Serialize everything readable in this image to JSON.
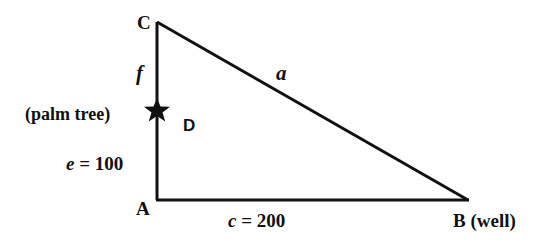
{
  "diagram": {
    "vertices": {
      "C": {
        "label": "C",
        "x": 157,
        "y": 22
      },
      "A": {
        "label": "A",
        "x": 157,
        "y": 200
      },
      "B": {
        "label": "B",
        "x": 468,
        "y": 200
      }
    },
    "point_D": {
      "label": "D",
      "x": 157,
      "y": 110,
      "note": "(palm tree)"
    },
    "labels": {
      "C": "C",
      "A": "A",
      "B": "B (well)",
      "f": "f",
      "a": "a",
      "palm_tree": "(palm tree)",
      "D": "D",
      "e": "e = 100",
      "c": "c = 200"
    },
    "colors": {
      "line": "#111111",
      "background": "#ffffff"
    }
  }
}
